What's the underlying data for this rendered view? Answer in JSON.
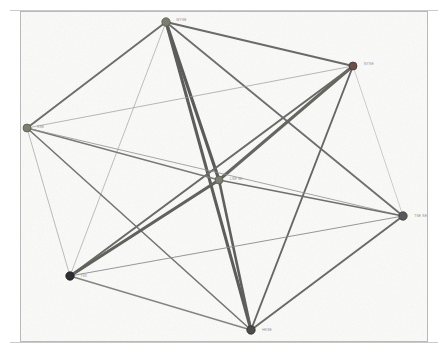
{
  "canvas": {
    "width": 448,
    "height": 353,
    "background_color": "#ffffff",
    "plot_background_color": "#fbfbfa",
    "border_color": "#b9b9b9",
    "rule_color": "#c9c9c9"
  },
  "graph": {
    "title": "",
    "type": "network-graph",
    "node_count": 7,
    "edge_count": 21,
    "label_color": "#8d8d8d",
    "nodes": [
      {
        "id": "n-top",
        "label": "WYSE",
        "x": 166,
        "y": 22,
        "radius": 4.2,
        "color": "#7d7d6e",
        "stroke": "#5c5c52",
        "label_dx": 6,
        "label_dy": -2
      },
      {
        "id": "n-upper-right",
        "label": "NYSE",
        "x": 353,
        "y": 66,
        "radius": 4.0,
        "color": "#6b4f4a",
        "stroke": "#4a3531",
        "label_dx": 7,
        "label_dy": -2
      },
      {
        "id": "n-left",
        "label": "SSE",
        "x": 27,
        "y": 128,
        "radius": 4.0,
        "color": "#7e7e70",
        "stroke": "#5c5c52",
        "label_dx": 6,
        "label_dy": -1
      },
      {
        "id": "n-center",
        "label": "LSE SE",
        "x": 219,
        "y": 180,
        "radius": 4.0,
        "color": "#7e7e72",
        "stroke": "#5a5a50",
        "label_dx": 7,
        "label_dy": -1
      },
      {
        "id": "n-right",
        "label": "TSE SE",
        "x": 403,
        "y": 216,
        "radius": 4.2,
        "color": "#595959",
        "stroke": "#3a3a3a",
        "label_dx": 7,
        "label_dy": 0
      },
      {
        "id": "n-bottom-left",
        "label": "TSX",
        "x": 70,
        "y": 276,
        "radius": 4.2,
        "color": "#2f2f33",
        "stroke": "#1c1c20",
        "label_dx": 6,
        "label_dy": 0
      },
      {
        "id": "n-bottom",
        "label": "HKSE",
        "x": 251,
        "y": 330,
        "radius": 4.2,
        "color": "#4c4c4c",
        "stroke": "#2e2e2e",
        "label_dx": 7,
        "label_dy": 0
      }
    ],
    "edges": [
      {
        "source": "n-top",
        "target": "n-upper-right",
        "width": 1.9,
        "color": "#6a6a6a"
      },
      {
        "source": "n-top",
        "target": "n-left",
        "width": 1.9,
        "color": "#6d6d6d"
      },
      {
        "source": "n-top",
        "target": "n-center",
        "width": 3.2,
        "color": "#5b5b5b"
      },
      {
        "source": "n-top",
        "target": "n-right",
        "width": 1.8,
        "color": "#6e6e6e"
      },
      {
        "source": "n-top",
        "target": "n-bottom-left",
        "width": 0.7,
        "color": "#a4a4a4"
      },
      {
        "source": "n-top",
        "target": "n-bottom",
        "width": 3.0,
        "color": "#5d5d5d"
      },
      {
        "source": "n-upper-right",
        "target": "n-left",
        "width": 0.7,
        "color": "#999999"
      },
      {
        "source": "n-upper-right",
        "target": "n-center",
        "width": 3.0,
        "color": "#666660"
      },
      {
        "source": "n-upper-right",
        "target": "n-right",
        "width": 0.6,
        "color": "#b0b0b0"
      },
      {
        "source": "n-upper-right",
        "target": "n-bottom-left",
        "width": 2.1,
        "color": "#6b6b66"
      },
      {
        "source": "n-upper-right",
        "target": "n-bottom",
        "width": 1.9,
        "color": "#666666"
      },
      {
        "source": "n-left",
        "target": "n-center",
        "width": 1.5,
        "color": "#7a7a74"
      },
      {
        "source": "n-left",
        "target": "n-right",
        "width": 0.8,
        "color": "#8f8f8f"
      },
      {
        "source": "n-left",
        "target": "n-bottom-left",
        "width": 0.7,
        "color": "#a0a0a0"
      },
      {
        "source": "n-left",
        "target": "n-bottom",
        "width": 1.6,
        "color": "#757575"
      },
      {
        "source": "n-center",
        "target": "n-right",
        "width": 1.6,
        "color": "#70706a"
      },
      {
        "source": "n-center",
        "target": "n-bottom-left",
        "width": 3.1,
        "color": "#62625c"
      },
      {
        "source": "n-center",
        "target": "n-bottom",
        "width": 2.6,
        "color": "#5f5f5f"
      },
      {
        "source": "n-right",
        "target": "n-bottom-left",
        "width": 0.9,
        "color": "#8b8b8b"
      },
      {
        "source": "n-right",
        "target": "n-bottom",
        "width": 2.0,
        "color": "#6a6a6a"
      },
      {
        "source": "n-bottom-left",
        "target": "n-bottom",
        "width": 1.4,
        "color": "#848480"
      }
    ]
  }
}
